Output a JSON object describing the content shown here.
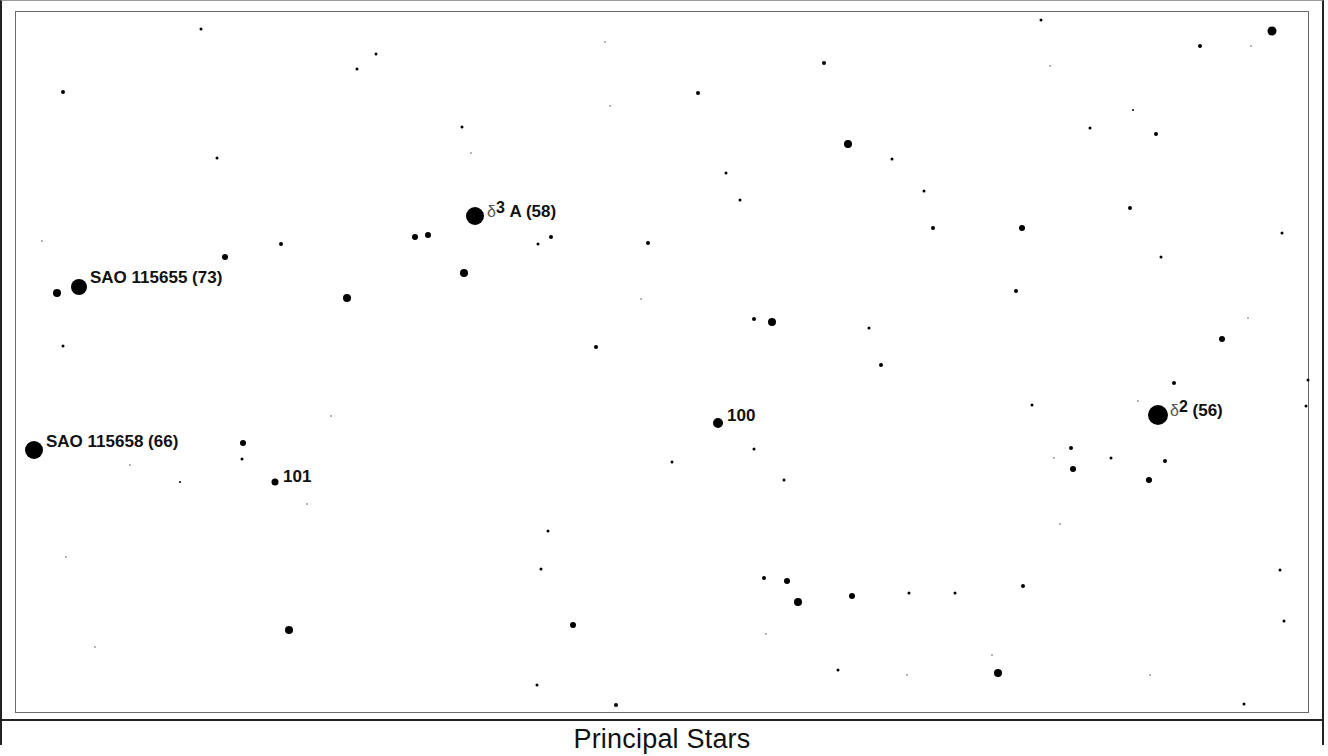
{
  "caption": "Principal Stars",
  "colors": {
    "star": "#000000",
    "faint_star": "#9a9a9a",
    "frame": "#6a6a6a",
    "background": "#ffffff"
  },
  "labels": [
    {
      "id": "sao-115655",
      "greek": "",
      "sup": "",
      "text": "SAO 115655 (73)",
      "x": 90,
      "y": 268
    },
    {
      "id": "sao-115658",
      "greek": "",
      "sup": "",
      "text": "SAO 115658 (66)",
      "x": 46,
      "y": 432
    },
    {
      "id": "delta3-a",
      "greek": "δ",
      "sup": "3",
      "text": " A (58)",
      "x": 487,
      "y": 198
    },
    {
      "id": "delta2",
      "greek": "δ",
      "sup": "2",
      "text": " (56)",
      "x": 1170,
      "y": 397
    },
    {
      "id": "star-100",
      "greek": "",
      "sup": "",
      "text": "100",
      "x": 727,
      "y": 406
    },
    {
      "id": "star-101",
      "greek": "",
      "sup": "",
      "text": "101",
      "x": 283,
      "y": 467
    }
  ],
  "stars": [
    {
      "x": 79,
      "y": 287,
      "r": 16
    },
    {
      "x": 34,
      "y": 450,
      "r": 18
    },
    {
      "x": 475,
      "y": 216,
      "r": 18
    },
    {
      "x": 1158,
      "y": 415,
      "r": 20
    },
    {
      "x": 718,
      "y": 423,
      "r": 10
    },
    {
      "x": 275,
      "y": 482,
      "r": 7
    },
    {
      "x": 57,
      "y": 293,
      "r": 8
    },
    {
      "x": 1272,
      "y": 31,
      "r": 9
    },
    {
      "x": 848,
      "y": 144,
      "r": 8
    },
    {
      "x": 464,
      "y": 273,
      "r": 8
    },
    {
      "x": 347,
      "y": 298,
      "r": 8
    },
    {
      "x": 772,
      "y": 322,
      "r": 8
    },
    {
      "x": 289,
      "y": 630,
      "r": 8
    },
    {
      "x": 798,
      "y": 602,
      "r": 8
    },
    {
      "x": 998,
      "y": 673,
      "r": 8
    },
    {
      "x": 1022,
      "y": 228,
      "r": 6
    },
    {
      "x": 1222,
      "y": 339,
      "r": 6
    },
    {
      "x": 1073,
      "y": 469,
      "r": 6
    },
    {
      "x": 1149,
      "y": 480,
      "r": 6
    },
    {
      "x": 852,
      "y": 596,
      "r": 6
    },
    {
      "x": 787,
      "y": 581,
      "r": 6
    },
    {
      "x": 573,
      "y": 625,
      "r": 6
    },
    {
      "x": 243,
      "y": 443,
      "r": 6
    },
    {
      "x": 225,
      "y": 257,
      "r": 6
    },
    {
      "x": 415,
      "y": 237,
      "r": 6
    },
    {
      "x": 428,
      "y": 235,
      "r": 6
    },
    {
      "x": 63,
      "y": 92,
      "r": 4
    },
    {
      "x": 201,
      "y": 29,
      "r": 3
    },
    {
      "x": 217,
      "y": 158,
      "r": 3
    },
    {
      "x": 357,
      "y": 69,
      "r": 3
    },
    {
      "x": 376,
      "y": 54,
      "r": 3
    },
    {
      "x": 281,
      "y": 244,
      "r": 4
    },
    {
      "x": 462,
      "y": 127,
      "r": 3
    },
    {
      "x": 698,
      "y": 93,
      "r": 4
    },
    {
      "x": 824,
      "y": 63,
      "r": 4
    },
    {
      "x": 1041,
      "y": 20,
      "r": 3
    },
    {
      "x": 1200,
      "y": 46,
      "r": 4
    },
    {
      "x": 1090,
      "y": 128,
      "r": 3
    },
    {
      "x": 1156,
      "y": 134,
      "r": 4
    },
    {
      "x": 1133,
      "y": 110,
      "r": 2
    },
    {
      "x": 892,
      "y": 159,
      "r": 3
    },
    {
      "x": 726,
      "y": 173,
      "r": 3
    },
    {
      "x": 740,
      "y": 200,
      "r": 3
    },
    {
      "x": 924,
      "y": 191,
      "r": 3
    },
    {
      "x": 1130,
      "y": 208,
      "r": 4
    },
    {
      "x": 933,
      "y": 228,
      "r": 4
    },
    {
      "x": 1161,
      "y": 257,
      "r": 3
    },
    {
      "x": 1282,
      "y": 233,
      "r": 3
    },
    {
      "x": 648,
      "y": 243,
      "r": 4
    },
    {
      "x": 551,
      "y": 237,
      "r": 4
    },
    {
      "x": 538,
      "y": 244,
      "r": 3
    },
    {
      "x": 1016,
      "y": 291,
      "r": 4
    },
    {
      "x": 754,
      "y": 319,
      "r": 4
    },
    {
      "x": 869,
      "y": 328,
      "r": 3
    },
    {
      "x": 881,
      "y": 365,
      "r": 4
    },
    {
      "x": 596,
      "y": 347,
      "r": 4
    },
    {
      "x": 63,
      "y": 346,
      "r": 3
    },
    {
      "x": 1174,
      "y": 383,
      "r": 4
    },
    {
      "x": 1032,
      "y": 405,
      "r": 3
    },
    {
      "x": 1308,
      "y": 380,
      "r": 3
    },
    {
      "x": 1306,
      "y": 406,
      "r": 3
    },
    {
      "x": 1071,
      "y": 448,
      "r": 4
    },
    {
      "x": 1111,
      "y": 458,
      "r": 3
    },
    {
      "x": 1165,
      "y": 461,
      "r": 4
    },
    {
      "x": 754,
      "y": 449,
      "r": 3
    },
    {
      "x": 784,
      "y": 480,
      "r": 3
    },
    {
      "x": 672,
      "y": 462,
      "r": 3
    },
    {
      "x": 242,
      "y": 459,
      "r": 3
    },
    {
      "x": 180,
      "y": 482,
      "r": 2
    },
    {
      "x": 548,
      "y": 531,
      "r": 3
    },
    {
      "x": 541,
      "y": 569,
      "r": 3
    },
    {
      "x": 764,
      "y": 578,
      "r": 4
    },
    {
      "x": 909,
      "y": 593,
      "r": 3
    },
    {
      "x": 955,
      "y": 593,
      "r": 3
    },
    {
      "x": 1023,
      "y": 586,
      "r": 4
    },
    {
      "x": 1280,
      "y": 570,
      "r": 3
    },
    {
      "x": 1284,
      "y": 621,
      "r": 3
    },
    {
      "x": 838,
      "y": 670,
      "r": 3
    },
    {
      "x": 537,
      "y": 685,
      "r": 3
    },
    {
      "x": 616,
      "y": 705,
      "r": 4
    },
    {
      "x": 1244,
      "y": 704,
      "r": 3
    },
    {
      "x": 66,
      "y": 557,
      "r": 2,
      "faint": true
    },
    {
      "x": 95,
      "y": 647,
      "r": 2,
      "faint": true
    },
    {
      "x": 307,
      "y": 504,
      "r": 2,
      "faint": true
    },
    {
      "x": 471,
      "y": 153,
      "r": 2,
      "faint": true
    },
    {
      "x": 42,
      "y": 241,
      "r": 2,
      "faint": true
    },
    {
      "x": 1050,
      "y": 66,
      "r": 2,
      "faint": true
    },
    {
      "x": 1251,
      "y": 46,
      "r": 2,
      "faint": true
    },
    {
      "x": 1248,
      "y": 318,
      "r": 2,
      "faint": true
    },
    {
      "x": 1138,
      "y": 401,
      "r": 2,
      "faint": true
    },
    {
      "x": 1054,
      "y": 458,
      "r": 2,
      "faint": true
    },
    {
      "x": 1060,
      "y": 524,
      "r": 2,
      "faint": true
    },
    {
      "x": 1150,
      "y": 675,
      "r": 2,
      "faint": true
    },
    {
      "x": 907,
      "y": 675,
      "r": 2,
      "faint": true
    },
    {
      "x": 992,
      "y": 655,
      "r": 2,
      "faint": true
    },
    {
      "x": 331,
      "y": 416,
      "r": 2,
      "faint": true
    },
    {
      "x": 641,
      "y": 299,
      "r": 2,
      "faint": true
    },
    {
      "x": 605,
      "y": 42,
      "r": 2,
      "faint": true
    },
    {
      "x": 610,
      "y": 106,
      "r": 2,
      "faint": true
    },
    {
      "x": 766,
      "y": 634,
      "r": 2,
      "faint": true
    },
    {
      "x": 130,
      "y": 465,
      "r": 2,
      "faint": true
    }
  ]
}
